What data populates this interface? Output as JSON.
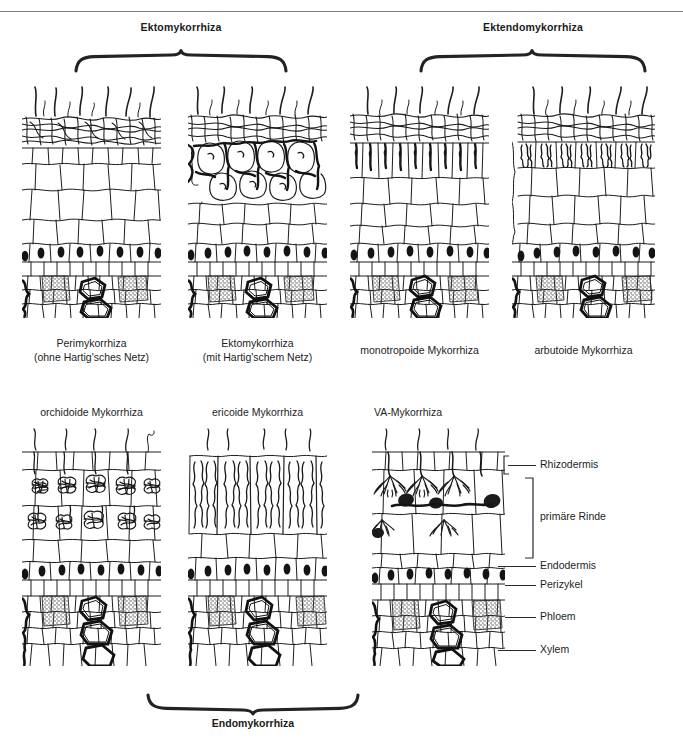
{
  "figure": {
    "header_ghost": "",
    "top_groups": [
      {
        "id": "ektomykorrhiza",
        "label": "Ektomykorrhiza"
      },
      {
        "id": "ektendomykorrhiza",
        "label": "Ektendomykorrhiza"
      }
    ],
    "bottom_group": {
      "id": "endomykorrhiza",
      "label": "Endomykorrhiza"
    }
  },
  "panels_row1": [
    {
      "id": "perimykorrhiza",
      "caption_line1": "Perimykorrhiza",
      "caption_line2": "(ohne Hartig'sches Netz)",
      "fungus_mode": "mantle-only"
    },
    {
      "id": "ektomykorrhiza",
      "caption_line1": "Ektomykorrhiza",
      "caption_line2": "(mit Hartig'schem Netz)",
      "fungus_mode": "hartig-net"
    },
    {
      "id": "monotropoide-mykorrhiza",
      "caption_line1": "monotropoide Mykorrhiza",
      "caption_line2": "",
      "fungus_mode": "hyphal-pegs"
    },
    {
      "id": "arbutoide-mykorrhiza",
      "caption_line1": "arbutoide Mykorrhiza",
      "caption_line2": "",
      "fungus_mode": "epidermal-coils"
    }
  ],
  "panels_row2": [
    {
      "id": "orchidoide-mykorrhiza",
      "caption_line1": "orchidoide Mykorrhiza",
      "caption_line2": "",
      "fungus_mode": "pelotons"
    },
    {
      "id": "ericoide-mykorrhiza",
      "caption_line1": "ericoide Mykorrhiza",
      "caption_line2": "",
      "fungus_mode": "wavy-hyphae"
    },
    {
      "id": "va-mykorrhiza",
      "caption_line1": "VA-Mykorrhiza",
      "caption_line2": "",
      "fungus_mode": "arbuscules-vesicles"
    }
  ],
  "tissue_labels": [
    {
      "id": "rhizodermis",
      "label": "Rhizodermis",
      "marker": "line"
    },
    {
      "id": "primaere-rinde",
      "label": "primäre Rinde",
      "marker": "bracket"
    },
    {
      "id": "endodermis",
      "label": "Endodermis",
      "marker": "line"
    },
    {
      "id": "perizykel",
      "label": "Perizykel",
      "marker": "line"
    },
    {
      "id": "phloem",
      "label": "Phloem",
      "marker": "line"
    },
    {
      "id": "xylem",
      "label": "Xylem",
      "marker": "line"
    }
  ],
  "colors": {
    "ink": "#1a1a1a",
    "line": "#2a2a2a",
    "rule": "#7c7c7c",
    "paper": "#ffffff",
    "stipple": "#5a5a5a"
  }
}
